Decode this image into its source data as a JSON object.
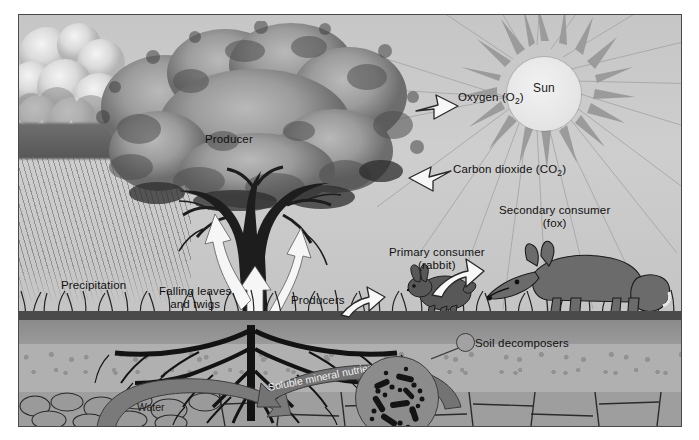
{
  "figure": {
    "type": "science-illustration"
  },
  "sky": {
    "sun_label": "Sun"
  },
  "labels": {
    "producer": "Producer",
    "oxygen": "Oxygen (O",
    "oxygen_sub": "2",
    "oxygen_tail": ")",
    "carbon_dioxide": "Carbon dioxide (CO",
    "carbon_dioxide_sub": "2",
    "carbon_dioxide_tail": ")",
    "precipitation": "Precipitation",
    "falling_leaves_line1": "Falling leaves",
    "falling_leaves_line2": "and twigs",
    "producers": "Producers",
    "primary_consumer_line1": "Primary consumer",
    "primary_consumer_line2": "(rabbit)",
    "secondary_consumer_line1": "Secondary consumer",
    "secondary_consumer_line2": "(fox)",
    "soil_decomposers": "Soil decomposers",
    "water": "Water",
    "soluble_mineral_nutrients": "Soluble mineral nutrients"
  },
  "icons": {
    "sun": "sun-icon",
    "cloud": "cloud-icon",
    "rain": "rain-icon",
    "tree": "tree-icon",
    "rabbit": "rabbit-icon",
    "fox": "fox-icon",
    "grass": "grass-icon",
    "bacteria": "bacteria-icon",
    "oxygen_arrow": "arrow-right-icon",
    "co2_arrow": "arrow-left-icon",
    "rabbit_arrow": "arrow-up-right-icon",
    "fox_arrow": "arrow-up-right-icon",
    "sap_arrows": "arrow-up-trident-icon",
    "water_arrow": "curved-arrow-right-icon",
    "minerals_arrow": "curved-arrow-left-icon"
  },
  "colors": {
    "background": "#ffffff",
    "sky": "#c9c9c9",
    "border": "#4a4a4a",
    "topsoil": "#8a8a8a",
    "subsoil": "#b0b0b0",
    "bedrock": "#9e9e9e",
    "canopy": "#8f8f8f",
    "arrow_fill": "#f4f4f4",
    "arrow_stroke": "#2a2a2a",
    "curve_arrow": "#6e6e6e",
    "text": "#111111"
  }
}
